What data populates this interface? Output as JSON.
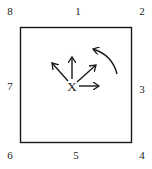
{
  "diagram": {
    "type": "neighborhood-direction-diagram",
    "center_label": "X",
    "square": {
      "x": 20,
      "y": 27,
      "width": 111,
      "height": 115,
      "stroke": "#1a1a1a"
    },
    "neighbors": [
      {
        "label": "1",
        "position": "top",
        "x": 72,
        "y": 5
      },
      {
        "label": "2",
        "position": "top-right",
        "x": 136,
        "y": 5
      },
      {
        "label": "3",
        "position": "right",
        "x": 136,
        "y": 83
      },
      {
        "label": "4",
        "position": "bottom-right",
        "x": 136,
        "y": 149
      },
      {
        "label": "5",
        "position": "bottom",
        "x": 70,
        "y": 149
      },
      {
        "label": "6",
        "position": "bottom-left",
        "x": 4,
        "y": 149
      },
      {
        "label": "7",
        "position": "left",
        "x": 4,
        "y": 80
      },
      {
        "label": "8",
        "position": "top-left",
        "x": 4,
        "y": 5
      }
    ],
    "arrows": [
      {
        "direction": "up-left",
        "points_to": "8"
      },
      {
        "direction": "up",
        "points_to": "1"
      },
      {
        "direction": "up-right",
        "points_to": "2"
      },
      {
        "direction": "right",
        "points_to": "3"
      }
    ],
    "curved_arrow": {
      "meaning": "counterclockwise rotation from 3 toward 1",
      "direction": "counterclockwise"
    },
    "colors": {
      "ink": "#1a1a1a",
      "background": "#ffffff"
    }
  }
}
